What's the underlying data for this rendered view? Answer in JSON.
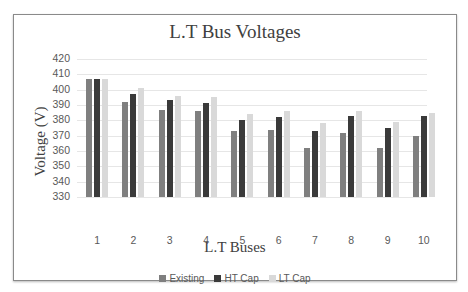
{
  "chart_data": {
    "type": "bar",
    "title": "L.T Bus Voltages",
    "xlabel": "L.T Buses",
    "ylabel": "Voltage (V)",
    "ylim": [
      330,
      420
    ],
    "yticks": [
      330,
      340,
      350,
      360,
      370,
      380,
      390,
      400,
      410,
      420
    ],
    "grid": true,
    "legend_position": "bottom",
    "categories": [
      "1",
      "2",
      "3",
      "4",
      "5",
      "6",
      "7",
      "8",
      "9",
      "10"
    ],
    "series": [
      {
        "name": "Existing",
        "color": "#7f7f7f",
        "values": [
          407,
          392,
          387,
          386,
          373,
          374,
          362,
          372,
          362,
          370
        ]
      },
      {
        "name": "HT Cap",
        "color": "#3a3a3a",
        "values": [
          407,
          397,
          393,
          391,
          380,
          382,
          373,
          383,
          375,
          383
        ]
      },
      {
        "name": "LT Cap",
        "color": "#d9d9d9",
        "values": [
          407,
          401,
          396,
          395,
          384,
          386,
          378,
          386,
          379,
          385
        ]
      }
    ]
  }
}
